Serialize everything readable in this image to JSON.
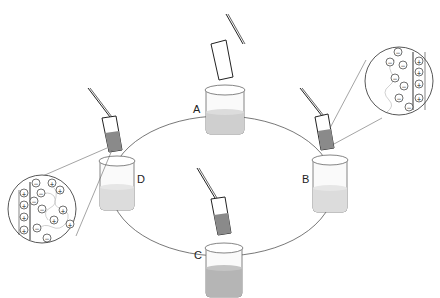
{
  "diagram": {
    "title": "",
    "colors": {
      "line": "#444444",
      "liquid": "#d6d6d6",
      "strip_stain": "#8a8a8a",
      "strip_light": "#bdbdbd",
      "glass": "#fafafa"
    },
    "beakers": [
      {
        "id": "A",
        "label": "A",
        "stain_level": "none",
        "liquid": "medium"
      },
      {
        "id": "B",
        "label": "B",
        "stain_level": "half",
        "liquid": "light"
      },
      {
        "id": "C",
        "label": "C",
        "stain_level": "half",
        "liquid": "dark"
      },
      {
        "id": "D",
        "label": "D",
        "stain_level": "half",
        "liquid": "light"
      }
    ],
    "insets": [
      {
        "id": "inset-B",
        "description": "Magnified view at strip surface: positive charges on surface, negative ions in adjacent layer",
        "surface_charges": [
          "+",
          "+",
          "+",
          "+"
        ],
        "solution_ions": [
          "−",
          "−",
          "−",
          "−",
          "−",
          "−",
          "−",
          "−"
        ]
      },
      {
        "id": "inset-D",
        "description": "Magnified view at strip surface: positive charges on surface, mixed ions in solution",
        "surface_charges": [
          "+",
          "+",
          "+",
          "+"
        ],
        "solution_ions": [
          "−",
          "+",
          "+",
          "−",
          "−",
          "+",
          "−",
          "+",
          "−",
          "+",
          "−",
          "−"
        ]
      }
    ]
  }
}
